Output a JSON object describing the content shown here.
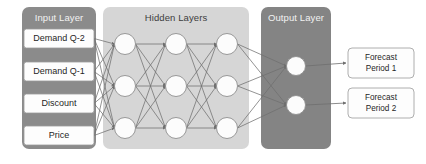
{
  "diagram": {
    "type": "neural-network",
    "title": "",
    "background": "#ffffff",
    "width": 426,
    "height": 164
  },
  "palette": {
    "input_panel": "#8b8b8b",
    "hidden_panel": "#d6d6d6",
    "output_panel": "#848484",
    "panel_title_light": "#f2f2f2",
    "panel_title_dark": "#3d3d3d",
    "node_fill": "#fcfcfc",
    "node_stroke": "#8e8e8e",
    "edge": "#6f6f6f",
    "box_fill": "#fdfdfd",
    "box_stroke": "#9a9a9a",
    "label_text": "#1f1f1f"
  },
  "layers": {
    "input": {
      "title": "Input Layer",
      "title_color": "light",
      "panel": {
        "x": 22,
        "y": 7,
        "w": 74,
        "h": 142,
        "r": 7,
        "fill": "#8b8b8b"
      },
      "title_pos": {
        "x": 59,
        "y": 18
      },
      "nodes": [
        {
          "label": "Demand Q-2",
          "x": 24,
          "y": 29,
          "w": 70,
          "h": 19
        },
        {
          "label": "Demand Q-1",
          "x": 24,
          "y": 62,
          "w": 70,
          "h": 19
        },
        {
          "label": "Discount",
          "x": 24,
          "y": 94,
          "w": 70,
          "h": 19
        },
        {
          "label": "Price",
          "x": 24,
          "y": 126,
          "w": 70,
          "h": 19
        }
      ]
    },
    "hidden": {
      "title": "Hidden Layers",
      "title_color": "dark",
      "panel": {
        "x": 103,
        "y": 7,
        "w": 146,
        "h": 142,
        "r": 7,
        "fill": "#d6d6d6"
      },
      "title_pos": {
        "x": 176,
        "y": 18
      },
      "columns": [
        {
          "name": "hidden-column-1",
          "cx": 125,
          "nodes_cy": [
            44,
            86,
            128
          ]
        },
        {
          "name": "hidden-column-2",
          "cx": 176,
          "nodes_cy": [
            44,
            86,
            128
          ]
        },
        {
          "name": "hidden-column-3",
          "cx": 227,
          "nodes_cy": [
            44,
            86,
            128
          ]
        }
      ],
      "node_radius": 10.5
    },
    "output": {
      "title": "Output Layer",
      "title_color": "light",
      "panel": {
        "x": 261,
        "y": 7,
        "w": 70,
        "h": 142,
        "r": 7,
        "fill": "#848484"
      },
      "title_pos": {
        "x": 296,
        "y": 18
      },
      "nodes_cy": [
        66,
        105
      ],
      "cx": 296,
      "node_radius": 9.5
    },
    "forecast": {
      "boxes": [
        {
          "label_line1": "Forecast",
          "label_line2": "Period 1",
          "x": 348,
          "y": 48,
          "w": 66,
          "h": 30
        },
        {
          "label_line1": "Forecast",
          "label_line2": "Period 2",
          "x": 348,
          "y": 88,
          "w": 66,
          "h": 30
        }
      ]
    }
  },
  "edges": {
    "input_to_hidden_desc": "each of the 4 input boxes connects to each of the 3 first-column hidden nodes",
    "hidden_interconnect_desc": "full mesh between consecutive hidden columns (3x3 each)",
    "hidden_to_output_desc": "each of the 3 third-column hidden nodes connects to each of the 2 output nodes",
    "output_to_forecast_desc": "output node 1 to Forecast Period 1, output node 2 to Forecast Period 2"
  }
}
